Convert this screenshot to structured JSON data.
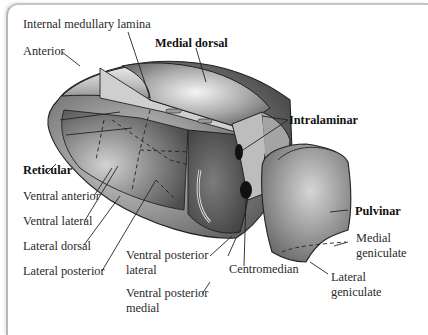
{
  "diagram": {
    "labels": {
      "internal_medullary_lamina": "Internal medullary lamina",
      "anterior": "Anterior",
      "medial_dorsal": "Medial dorsal",
      "intralaminar": "Intralaminar",
      "reticular": "Reticular",
      "ventral_anterior": "Ventral anterior",
      "ventral_lateral": "Ventral lateral",
      "lateral_dorsal": "Lateral dorsal",
      "lateral_posterior": "Lateral posterior",
      "ventral_posterior_lateral_1": "Ventral posterior",
      "ventral_posterior_lateral_2": "lateral",
      "ventral_posterior_medial_1": "Ventral posterior",
      "ventral_posterior_medial_2": "medial",
      "centromedian": "Centromedian",
      "pulvinar": "Pulvinar",
      "medial_geniculate_1": "Medial",
      "medial_geniculate_2": "geniculate",
      "lateral_geniculate_1": "Lateral",
      "lateral_geniculate_2": "geniculate"
    },
    "bold_labels": [
      "Medial dorsal",
      "Intralaminar",
      "Reticular",
      "Pulvinar"
    ],
    "colors": {
      "background": "#ffffff",
      "frame": "#b8b8b8",
      "text": "#2a2a2a",
      "shape_light": "#d8d8d8",
      "shape_mid": "#9a9a9a",
      "shape_dark": "#5a5a5a",
      "outline": "#222222"
    }
  }
}
